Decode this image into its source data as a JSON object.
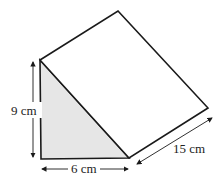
{
  "diagram": {
    "type": "triangular-prism",
    "labels": {
      "height": "9 cm",
      "base": "6 cm",
      "length": "15 cm"
    },
    "colors": {
      "stroke": "#1a1a1a",
      "face_fill": "#e6e6e6",
      "background": "#ffffff"
    }
  }
}
